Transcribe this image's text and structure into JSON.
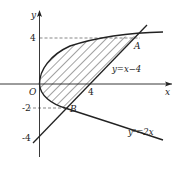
{
  "figure": {
    "type": "region-between-curves",
    "axes": {
      "x_label": "x",
      "y_label": "y",
      "origin_label": "O",
      "x_ticks": [
        "4"
      ],
      "y_ticks": [
        "4",
        "-2",
        "-4"
      ]
    },
    "curves": {
      "line_label": "y=x−4",
      "parabola_label": "y²=2x"
    },
    "points": {
      "A": {
        "label": "A",
        "coords": [
          8,
          4
        ]
      },
      "B": {
        "label": "B",
        "coords": [
          2,
          -2
        ]
      }
    },
    "colors": {
      "stroke": "#222222",
      "dashed": "#555555",
      "hatch": "#333333"
    }
  }
}
